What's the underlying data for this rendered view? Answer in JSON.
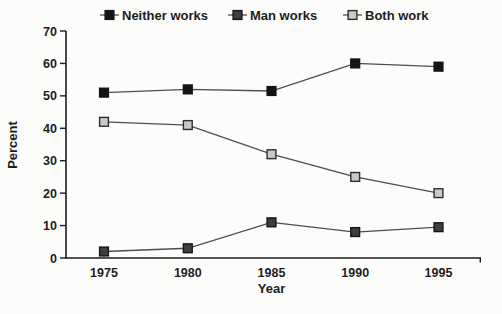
{
  "chart_data": {
    "type": "line",
    "title": "",
    "xlabel": "Year",
    "ylabel": "Percent",
    "categories": [
      "1975",
      "1980",
      "1985",
      "1990",
      "1995"
    ],
    "x": [
      1975,
      1980,
      1985,
      1990,
      1995
    ],
    "ylim": [
      0,
      70
    ],
    "yticks": [
      0,
      10,
      20,
      30,
      40,
      50,
      60,
      70
    ],
    "grid": false,
    "legend_position": "top",
    "axis_color": "#1c1c1c",
    "line_color": "#4d4d4d",
    "text_color": "#1c1c1c",
    "series": [
      {
        "name": "Neither works",
        "values": [
          51,
          52,
          51.5,
          60,
          59
        ],
        "marker": "square",
        "marker_fill": "#141414",
        "marker_stroke": "#141414"
      },
      {
        "name": "Man works",
        "values": [
          2,
          3,
          11,
          8,
          9.5
        ],
        "marker": "square",
        "marker_fill": "#3e3e3e",
        "marker_stroke": "#141414"
      },
      {
        "name": "Both work",
        "values": [
          42,
          41,
          32,
          25,
          20
        ],
        "marker": "square",
        "marker_fill": "#c9c9c7",
        "marker_stroke": "#2e2e2e"
      }
    ]
  }
}
